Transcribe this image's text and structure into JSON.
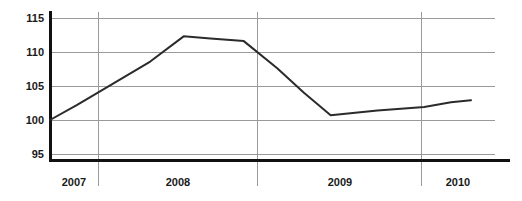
{
  "chart_data": {
    "type": "line",
    "title": "",
    "xlabel": "",
    "ylabel": "",
    "ylim": [
      92,
      116.5
    ],
    "yticks": [
      95,
      100,
      105,
      110,
      115
    ],
    "ytick_labels": [
      "95",
      "100",
      "105",
      "110",
      "115"
    ],
    "grid": true,
    "legend": false,
    "legend_position": "none",
    "xtick_labels": [
      "2007",
      "2008",
      "2009",
      "2010"
    ],
    "x_category_dividers": [
      98,
      257,
      421
    ],
    "series": [
      {
        "name": "index",
        "x": [
          2007.0,
          2007.2,
          2007.45,
          2007.75,
          2008.0,
          2008.2,
          2008.45,
          2008.7,
          2008.9,
          2009.1,
          2009.45,
          2009.8,
          2010.0,
          2010.15
        ],
        "values": [
          100.0,
          102.2,
          105.1,
          108.6,
          112.3,
          112.0,
          111.6,
          107.6,
          104.0,
          100.7,
          101.4,
          101.9,
          102.6,
          102.9
        ]
      }
    ]
  },
  "axis": {
    "y_label_00": "115",
    "y_label_01": "110",
    "y_label_02": "105",
    "y_label_03": "100",
    "y_label_04": "95",
    "x_label_00": "2007",
    "x_label_01": "2008",
    "x_label_02": "2009",
    "x_label_03": "2010"
  },
  "colors": {
    "line": "#2b2b2b",
    "grid": "#9a9a9a",
    "spine": "#111111",
    "background": "#ffffff",
    "text": "#1a1a1a"
  }
}
